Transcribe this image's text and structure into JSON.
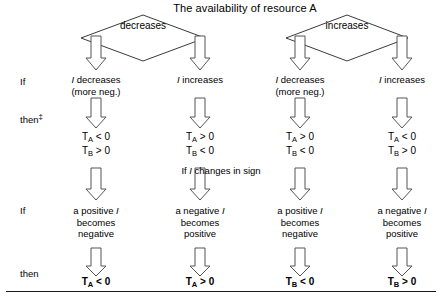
{
  "figure": {
    "title": "The availability of resource A",
    "bottom_rule": true
  },
  "rail_labels": [
    {
      "name": "if-row-1",
      "text": "If",
      "dagger": ""
    },
    {
      "name": "then-row-1",
      "text": "then",
      "dagger": "‡"
    },
    {
      "name": "if-row-2",
      "text": "If",
      "dagger": ""
    },
    {
      "name": "then-row-2",
      "text": "then",
      "dagger": ""
    }
  ],
  "diamonds": [
    {
      "name": "diamond-decreases",
      "label": "decreases"
    },
    {
      "name": "diamond-increases",
      "label": "increases"
    }
  ],
  "mid_note": {
    "prefix": "If ",
    "variable": "I",
    "suffix": " changes in sign"
  },
  "columns": [
    {
      "name": "column-1",
      "condition_lines": [
        {
          "variable": "I",
          "text": " decreases"
        },
        {
          "variable": "",
          "text": "(more neg.)"
        }
      ],
      "result_lines": [
        {
          "symbol": "T",
          "sub": "A",
          "relation": "< 0"
        },
        {
          "symbol": "T",
          "sub": "B",
          "relation": "> 0"
        }
      ],
      "sign_change_lines": [
        {
          "pre": "a positive ",
          "variable": "I",
          "post": ""
        },
        {
          "pre": "becomes",
          "variable": "",
          "post": ""
        },
        {
          "pre": "negative",
          "variable": "",
          "post": ""
        }
      ],
      "final_result": {
        "symbol": "T",
        "sub": "A",
        "relation": "< 0"
      }
    },
    {
      "name": "column-2",
      "condition_lines": [
        {
          "variable": "I",
          "text": " increases"
        }
      ],
      "result_lines": [
        {
          "symbol": "T",
          "sub": "A",
          "relation": "> 0"
        },
        {
          "symbol": "T",
          "sub": "B",
          "relation": "< 0"
        }
      ],
      "sign_change_lines": [
        {
          "pre": "a negative ",
          "variable": "I",
          "post": ""
        },
        {
          "pre": "becomes",
          "variable": "",
          "post": ""
        },
        {
          "pre": "positive",
          "variable": "",
          "post": ""
        }
      ],
      "final_result": {
        "symbol": "T",
        "sub": "A",
        "relation": "> 0"
      }
    },
    {
      "name": "column-3",
      "condition_lines": [
        {
          "variable": "I",
          "text": " decreases"
        },
        {
          "variable": "",
          "text": "(more neg.)"
        }
      ],
      "result_lines": [
        {
          "symbol": "T",
          "sub": "A",
          "relation": "> 0"
        },
        {
          "symbol": "T",
          "sub": "B",
          "relation": "< 0"
        }
      ],
      "sign_change_lines": [
        {
          "pre": "a positive ",
          "variable": "I",
          "post": ""
        },
        {
          "pre": "becomes",
          "variable": "",
          "post": ""
        },
        {
          "pre": "negative",
          "variable": "",
          "post": ""
        }
      ],
      "final_result": {
        "symbol": "T",
        "sub": "B",
        "relation": "< 0"
      }
    },
    {
      "name": "column-4",
      "condition_lines": [
        {
          "variable": "I",
          "text": " increases"
        }
      ],
      "result_lines": [
        {
          "symbol": "T",
          "sub": "A",
          "relation": "< 0"
        },
        {
          "symbol": "T",
          "sub": "B",
          "relation": "> 0"
        }
      ],
      "sign_change_lines": [
        {
          "pre": "a negative ",
          "variable": "I",
          "post": ""
        },
        {
          "pre": "becomes",
          "variable": "",
          "post": ""
        },
        {
          "pre": "positive",
          "variable": "",
          "post": ""
        }
      ],
      "final_result": {
        "symbol": "T",
        "sub": "B",
        "relation": "> 0"
      }
    }
  ],
  "colors": {
    "ink": "#000000",
    "line": "#3a3a3a",
    "arrow_stroke": "#555555",
    "arrow_fill": "#ffffff",
    "rule": "#1a1a1a"
  }
}
